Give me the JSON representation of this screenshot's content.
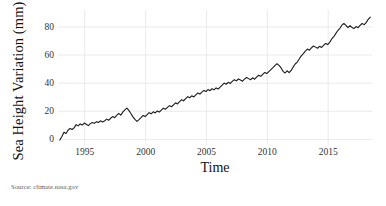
{
  "chart_data": {
    "type": "line",
    "title": "",
    "xlabel": "Time",
    "ylabel": "Sea Height Variation (mm)",
    "xlim": [
      1992.8,
      2018.6
    ],
    "ylim": [
      -4,
      92
    ],
    "xticks": [
      1995,
      2000,
      2005,
      2010,
      2015
    ],
    "xtick_labels": [
      "1995",
      "2000",
      "2005",
      "2010",
      "2015"
    ],
    "yticks": [
      0,
      20,
      40,
      60,
      80
    ],
    "ytick_labels": [
      "0",
      "20",
      "40",
      "60",
      "80"
    ],
    "grid": true,
    "grid_color": "#e8e8e8",
    "legend": "none",
    "line_color": "#1a1a1a",
    "line_width": 1.1,
    "source": "Source: climate.nasa.gov",
    "series": [
      {
        "name": "Sea Height Variation",
        "units": "mm",
        "x": [
          1992.95,
          1993.12,
          1993.29,
          1993.46,
          1993.62,
          1993.79,
          1993.96,
          1994.12,
          1994.29,
          1994.46,
          1994.62,
          1994.79,
          1994.96,
          1995.12,
          1995.29,
          1995.46,
          1995.62,
          1995.79,
          1995.96,
          1996.12,
          1996.29,
          1996.46,
          1996.62,
          1996.79,
          1996.96,
          1997.12,
          1997.29,
          1997.46,
          1997.62,
          1997.79,
          1997.96,
          1998.12,
          1998.29,
          1998.46,
          1998.62,
          1998.79,
          1998.96,
          1999.12,
          1999.29,
          1999.46,
          1999.62,
          1999.79,
          1999.96,
          2000.12,
          2000.29,
          2000.46,
          2000.62,
          2000.79,
          2000.96,
          2001.12,
          2001.29,
          2001.46,
          2001.62,
          2001.79,
          2001.96,
          2002.12,
          2002.29,
          2002.46,
          2002.62,
          2002.79,
          2002.96,
          2003.12,
          2003.29,
          2003.46,
          2003.62,
          2003.79,
          2003.96,
          2004.12,
          2004.29,
          2004.46,
          2004.62,
          2004.79,
          2004.96,
          2005.12,
          2005.29,
          2005.46,
          2005.62,
          2005.79,
          2005.96,
          2006.12,
          2006.29,
          2006.46,
          2006.62,
          2006.79,
          2006.96,
          2007.12,
          2007.29,
          2007.46,
          2007.62,
          2007.79,
          2007.96,
          2008.12,
          2008.29,
          2008.46,
          2008.62,
          2008.79,
          2008.96,
          2009.12,
          2009.29,
          2009.46,
          2009.62,
          2009.79,
          2009.96,
          2010.12,
          2010.29,
          2010.46,
          2010.62,
          2010.79,
          2010.96,
          2011.12,
          2011.29,
          2011.46,
          2011.62,
          2011.79,
          2011.96,
          2012.12,
          2012.29,
          2012.46,
          2012.62,
          2012.79,
          2012.96,
          2013.12,
          2013.29,
          2013.46,
          2013.62,
          2013.79,
          2013.96,
          2014.12,
          2014.29,
          2014.46,
          2014.62,
          2014.79,
          2014.96,
          2015.12,
          2015.29,
          2015.46,
          2015.62,
          2015.79,
          2015.96,
          2016.12,
          2016.29,
          2016.46,
          2016.62,
          2016.79,
          2016.96,
          2017.12,
          2017.29,
          2017.46,
          2017.62,
          2017.79,
          2017.96,
          2018.12,
          2018.29,
          2018.46
        ],
        "y": [
          -0.5,
          2.0,
          5.0,
          4.2,
          6.5,
          7.8,
          7.0,
          8.2,
          10.5,
          9.6,
          11.0,
          10.2,
          11.6,
          10.8,
          9.8,
          11.2,
          12.0,
          11.4,
          12.6,
          12.0,
          13.2,
          12.4,
          13.0,
          14.4,
          13.6,
          15.0,
          16.2,
          15.4,
          17.0,
          18.5,
          17.2,
          19.4,
          21.0,
          22.2,
          20.6,
          18.4,
          16.0,
          14.2,
          12.8,
          14.0,
          15.4,
          17.0,
          16.2,
          17.6,
          19.0,
          18.2,
          19.6,
          18.8,
          20.2,
          19.4,
          20.8,
          22.2,
          21.4,
          22.8,
          24.0,
          23.2,
          24.6,
          26.0,
          25.2,
          26.8,
          28.2,
          27.4,
          29.0,
          30.4,
          29.6,
          31.0,
          30.2,
          31.6,
          33.0,
          32.2,
          33.6,
          34.8,
          34.0,
          35.4,
          34.6,
          36.0,
          35.2,
          36.6,
          35.8,
          37.2,
          38.6,
          40.0,
          39.2,
          40.6,
          39.8,
          41.2,
          42.4,
          41.6,
          43.0,
          42.2,
          41.4,
          42.8,
          44.0,
          43.2,
          42.4,
          43.8,
          42.8,
          44.2,
          45.6,
          44.8,
          46.2,
          47.6,
          46.8,
          48.2,
          49.6,
          51.0,
          52.4,
          53.8,
          52.6,
          51.0,
          48.4,
          47.2,
          48.8,
          47.4,
          49.0,
          51.4,
          53.6,
          55.0,
          57.2,
          59.4,
          61.0,
          62.8,
          64.2,
          63.4,
          65.0,
          66.4,
          65.6,
          64.8,
          66.2,
          65.4,
          66.8,
          68.2,
          67.4,
          69.0,
          71.4,
          73.0,
          75.2,
          77.4,
          79.0,
          81.2,
          82.4,
          81.0,
          79.4,
          80.8,
          79.6,
          78.8,
          80.2,
          79.4,
          81.0,
          82.4,
          81.6,
          83.0,
          85.4,
          87.0
        ]
      }
    ]
  },
  "labels": {
    "y_axis_title": "Sea Height Variation (mm)",
    "x_axis_title": "Time",
    "source_note": "Source: climate.nasa.gov"
  }
}
